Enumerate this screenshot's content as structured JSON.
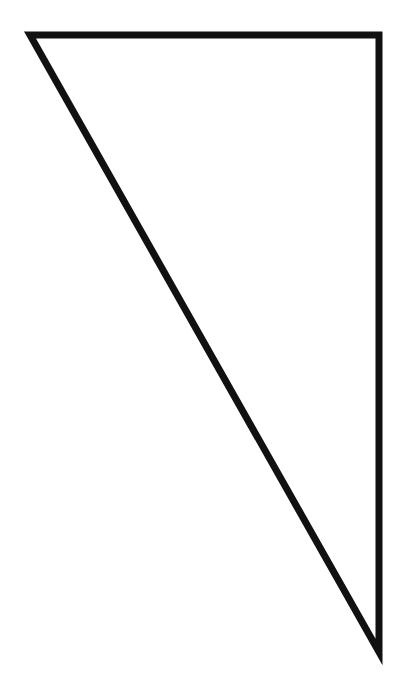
{
  "diagram": {
    "background": "#ffffff",
    "shapes": [
      {
        "type": "triangle",
        "name": "right-triangle",
        "points": [
          [
            30,
            35
          ],
          [
            379,
            35
          ],
          [
            379,
            652
          ]
        ],
        "stroke": "#111111",
        "stroke_width": 7,
        "fill": "#ffffff"
      }
    ]
  }
}
